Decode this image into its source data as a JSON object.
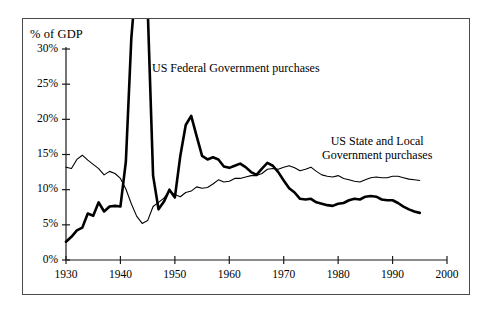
{
  "figure": {
    "border_color": "#4a4a4a",
    "background": "#ffffff",
    "ink_color": "#000000"
  },
  "axes": {
    "y_axis_title": "% of GDP",
    "y_ticks": [
      "0%",
      "5%",
      "10%",
      "15%",
      "20%",
      "25%",
      "30%"
    ],
    "x_ticks": [
      "1930",
      "1940",
      "1950",
      "1960",
      "1970",
      "1980",
      "1990",
      "2000"
    ]
  },
  "labels": {
    "federal": "US Federal Government purchases",
    "state_local_line1": "US State and Local",
    "state_local_line2": "Government purchases"
  },
  "chart_data": {
    "type": "line",
    "title": "",
    "xlabel": "",
    "ylabel": "% of GDP",
    "xlim": [
      1930,
      2000
    ],
    "ylim": [
      0,
      30
    ],
    "xticks": [
      1930,
      1940,
      1950,
      1960,
      1970,
      1980,
      1990,
      2000
    ],
    "yticks": [
      0,
      5,
      10,
      15,
      20,
      25,
      30
    ],
    "grid": false,
    "legend_position": "inline-annotations",
    "y_unit": "percent",
    "note": "Federal series spikes above the 30% axis maximum during World War II and is clipped at the top of the plot frame.",
    "series": [
      {
        "name": "US Federal Government purchases",
        "style": "thick",
        "line_width": 2.6,
        "color": "#000000",
        "x": [
          1930,
          1931,
          1932,
          1933,
          1934,
          1935,
          1936,
          1937,
          1938,
          1939,
          1940,
          1941,
          1942,
          1943,
          1944,
          1945,
          1946,
          1947,
          1948,
          1949,
          1950,
          1951,
          1952,
          1953,
          1954,
          1955,
          1956,
          1957,
          1958,
          1959,
          1960,
          1961,
          1962,
          1963,
          1964,
          1965,
          1966,
          1967,
          1968,
          1969,
          1970,
          1971,
          1972,
          1973,
          1974,
          1975,
          1976,
          1977,
          1978,
          1979,
          1980,
          1981,
          1982,
          1983,
          1984,
          1985,
          1986,
          1987,
          1988,
          1989,
          1990,
          1991,
          1992,
          1993,
          1994,
          1995
        ],
        "y": [
          2.6,
          3.3,
          4.2,
          4.6,
          6.6,
          6.3,
          8.2,
          6.9,
          7.6,
          7.7,
          7.6,
          14.0,
          31.5,
          41.0,
          42.0,
          36.0,
          12.0,
          7.2,
          8.3,
          10.0,
          8.9,
          14.8,
          19.2,
          20.5,
          17.6,
          14.8,
          14.3,
          14.6,
          14.3,
          13.3,
          13.1,
          13.4,
          13.7,
          13.2,
          12.5,
          12.1,
          13.0,
          13.8,
          13.4,
          12.5,
          11.3,
          10.2,
          9.6,
          8.7,
          8.6,
          8.7,
          8.2,
          8.0,
          7.8,
          7.7,
          8.0,
          8.1,
          8.5,
          8.7,
          8.6,
          9.0,
          9.1,
          9.0,
          8.6,
          8.5,
          8.5,
          8.1,
          7.6,
          7.2,
          6.9,
          6.7
        ]
      },
      {
        "name": "US State and Local Government purchases",
        "style": "thin",
        "line_width": 1.1,
        "color": "#000000",
        "x": [
          1930,
          1931,
          1932,
          1933,
          1934,
          1935,
          1936,
          1937,
          1938,
          1939,
          1940,
          1941,
          1942,
          1943,
          1944,
          1945,
          1946,
          1947,
          1948,
          1949,
          1950,
          1951,
          1952,
          1953,
          1954,
          1955,
          1956,
          1957,
          1958,
          1959,
          1960,
          1961,
          1962,
          1963,
          1964,
          1965,
          1966,
          1967,
          1968,
          1969,
          1970,
          1971,
          1972,
          1973,
          1974,
          1975,
          1976,
          1977,
          1978,
          1979,
          1980,
          1981,
          1982,
          1983,
          1984,
          1985,
          1986,
          1987,
          1988,
          1989,
          1990,
          1991,
          1992,
          1993,
          1994,
          1995
        ],
        "y": [
          13.2,
          13.0,
          14.3,
          14.9,
          14.2,
          13.6,
          13.0,
          12.1,
          12.6,
          12.3,
          11.6,
          10.1,
          8.0,
          6.2,
          5.2,
          5.6,
          7.6,
          8.2,
          8.8,
          9.8,
          9.3,
          9.0,
          9.6,
          9.8,
          10.4,
          10.2,
          10.3,
          10.8,
          11.4,
          11.1,
          11.2,
          11.6,
          11.6,
          11.8,
          12.0,
          12.0,
          12.3,
          12.9,
          13.0,
          12.9,
          13.2,
          13.4,
          13.1,
          12.7,
          12.9,
          13.2,
          12.6,
          12.1,
          11.9,
          11.8,
          12.0,
          11.6,
          11.4,
          11.2,
          11.1,
          11.4,
          11.7,
          11.8,
          11.7,
          11.7,
          11.9,
          11.9,
          11.7,
          11.5,
          11.4,
          11.3
        ]
      }
    ]
  }
}
